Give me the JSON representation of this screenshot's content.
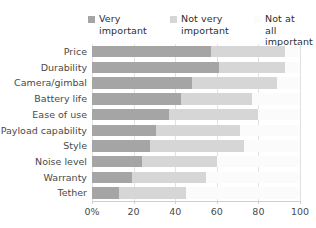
{
  "chart_data": {
    "type": "bar",
    "subtype": "stacked-horizontal-100pct",
    "title": "",
    "xlabel": "",
    "ylabel": "",
    "xlim": [
      0,
      100
    ],
    "xticks": [
      0,
      20,
      40,
      60,
      80,
      100
    ],
    "xtick_labels": [
      "0%",
      "20",
      "40",
      "60",
      "80",
      "100"
    ],
    "grid": true,
    "grid_axis": "x",
    "legend_position": "top",
    "categories": [
      "Price",
      "Durability",
      "Camera/gimbal",
      "Battery life",
      "Ease of use",
      "Payload capability",
      "Style",
      "Noise level",
      "Warranty",
      "Tether"
    ],
    "series": [
      {
        "name": "Very important",
        "legend_label": "Very\nimportant",
        "color": "#a5a5a5",
        "values": [
          57,
          61,
          48,
          43,
          37,
          31,
          28,
          24,
          19,
          13
        ]
      },
      {
        "name": "Not very important",
        "legend_label": "Not very\nimportant",
        "color": "#d6d6d6",
        "values": [
          36,
          32,
          41,
          34,
          43,
          40,
          45,
          36,
          36,
          32
        ]
      },
      {
        "name": "Not at all important",
        "legend_label": "Not at\nall important",
        "color": "#fbfbfb",
        "values": [
          7,
          7,
          11,
          23,
          20,
          29,
          27,
          40,
          45,
          55
        ]
      }
    ]
  },
  "legend": {
    "items": [
      {
        "label": "Very\nimportant",
        "color": "#a5a5a5",
        "swatch": true
      },
      {
        "label": "Not very\nimportant",
        "color": "#d6d6d6",
        "swatch": true
      },
      {
        "label": "Not at\nall important",
        "color": "#fbfbfb",
        "swatch": false
      }
    ]
  },
  "colors": {
    "very_important": "#a5a5a5",
    "not_very_important": "#d6d6d6",
    "not_at_all_important": "#fbfbfb",
    "gridline": "#e2e2e2",
    "axis": "#cfcfcf",
    "text": "#4a4a4a",
    "background": "#ffffff"
  }
}
